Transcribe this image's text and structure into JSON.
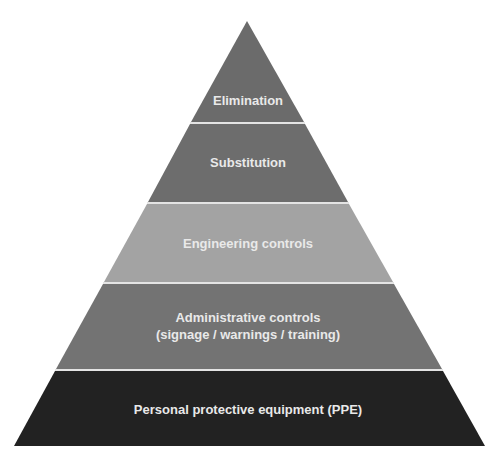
{
  "diagram": {
    "type": "pyramid",
    "divider_color": "#e4e4e4",
    "tiers": [
      {
        "id": "elimination",
        "label": "Elimination",
        "lines": [
          "Elimination"
        ],
        "color": "#6b6b6b"
      },
      {
        "id": "substitution",
        "label": "Substitution",
        "lines": [
          "Substitution"
        ],
        "color": "#6d6d6d"
      },
      {
        "id": "engineering-controls",
        "label": "Engineering controls",
        "lines": [
          "Engineering controls"
        ],
        "color": "#a3a3a3"
      },
      {
        "id": "administrative-controls",
        "label": "Administrative controls (signage / warnings / training)",
        "lines": [
          "Administrative controls",
          "(signage / warnings / training)"
        ],
        "color": "#737373"
      },
      {
        "id": "ppe",
        "label": "Personal protective equipment (PPE)",
        "lines": [
          "Personal protective equipment (PPE)"
        ],
        "color": "#222222"
      }
    ]
  }
}
